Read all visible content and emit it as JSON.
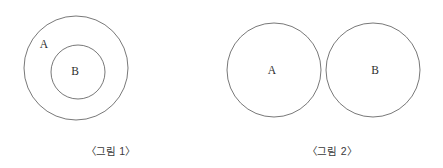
{
  "canvas": {
    "width": 443,
    "height": 168,
    "background": "#ffffff"
  },
  "style": {
    "stroke_color": "#555555",
    "stroke_width": 0.8,
    "hatch_color": "#4a4a4a",
    "label_color": "#2e2e2e",
    "caption_color": "#3a3a3a"
  },
  "figures": [
    {
      "id": "figure-1",
      "caption": "〈그림 1〉",
      "relation": "subset",
      "shapes": [
        {
          "name": "outer-circle-a",
          "label": "A",
          "cx": 76,
          "cy": 68,
          "r": 52,
          "fill": "none",
          "label_x": 44,
          "label_y": 45
        },
        {
          "name": "inner-circle-b",
          "label": "B",
          "cx": 78,
          "cy": 72,
          "r": 27,
          "fill": "none",
          "label_x": 75,
          "label_y": 72
        }
      ]
    },
    {
      "id": "figure-2",
      "caption": "〈그림 2〉",
      "relation": "intersection",
      "shapes": [
        {
          "name": "circle-a",
          "label": "A",
          "cx": 53,
          "cy": 70,
          "r": 47,
          "fill": "none",
          "label_x": 51,
          "label_y": 71
        },
        {
          "name": "circle-b",
          "label": "B",
          "cx": 152,
          "cy": 70,
          "r": 47,
          "fill": "none",
          "label_x": 154,
          "label_y": 71
        }
      ],
      "shaded_region": {
        "name": "intersection-region",
        "pattern": "cross-hatch",
        "description": "lens-shaped overlap of circle A and circle B"
      }
    }
  ]
}
